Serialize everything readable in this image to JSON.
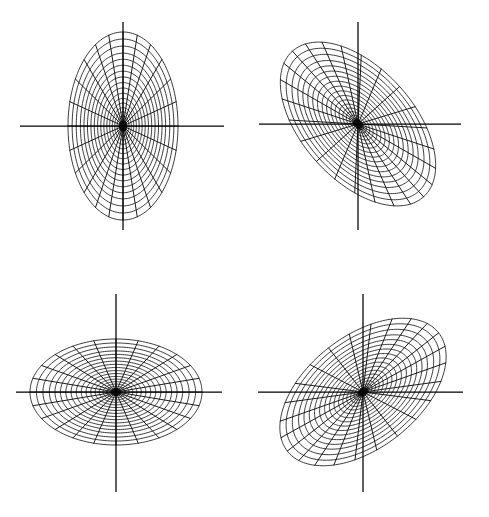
{
  "figure": {
    "background_color": "#ffffff",
    "line_color": "#1a1a1a",
    "axis_color": "#000000",
    "width": 489,
    "height": 517,
    "panel_count": 4,
    "layout": "2x2"
  },
  "chart_data": {
    "type": "scatter",
    "xlabel": "",
    "ylabel": "",
    "grid": true,
    "legend": "none",
    "panels": [
      {
        "name": "top-left",
        "label": "vertical ellipse",
        "center_x": 123,
        "center_y": 126,
        "semi_major": 94,
        "semi_minor": 55,
        "rotation_deg": 90,
        "n_spokes": 24,
        "n_rings": 18,
        "axis_h_start_x": 20,
        "axis_h_end_x": 224,
        "axis_v_start_y": 22,
        "axis_v_end_y": 230
      },
      {
        "name": "top-right",
        "label": "tilted ellipse descending right",
        "center_x": 358,
        "center_y": 124,
        "semi_major": 98,
        "semi_minor": 56,
        "rotation_deg": 48,
        "n_spokes": 24,
        "n_rings": 18,
        "axis_h_start_x": 259,
        "axis_h_end_x": 461,
        "axis_v_start_y": 22,
        "axis_v_end_y": 230
      },
      {
        "name": "bottom-left",
        "label": "horizontal ellipse",
        "center_x": 116,
        "center_y": 392,
        "semi_major": 86,
        "semi_minor": 53,
        "rotation_deg": 0,
        "n_spokes": 24,
        "n_rings": 18,
        "axis_h_start_x": 16,
        "axis_h_end_x": 222,
        "axis_v_start_y": 294,
        "axis_v_end_y": 492
      },
      {
        "name": "bottom-right",
        "label": "tilted ellipse ascending right",
        "center_x": 363,
        "center_y": 392,
        "semi_major": 96,
        "semi_minor": 56,
        "rotation_deg": -38,
        "n_spokes": 24,
        "n_rings": 18,
        "axis_h_start_x": 258,
        "axis_h_end_x": 463,
        "axis_v_start_y": 294,
        "axis_v_end_y": 492
      }
    ],
    "ring_radii_fraction": [
      0.035,
      0.07,
      0.108,
      0.15,
      0.195,
      0.243,
      0.294,
      0.348,
      0.404,
      0.462,
      0.522,
      0.583,
      0.646,
      0.71,
      0.775,
      0.85,
      0.925,
      1.0
    ],
    "spoke_angles_deg": [
      0,
      15,
      30,
      45,
      60,
      75,
      90,
      105,
      120,
      135,
      150,
      165,
      180,
      195,
      210,
      225,
      240,
      255,
      270,
      285,
      300,
      315,
      330,
      345
    ],
    "core_radius_fraction": 0.055
  }
}
